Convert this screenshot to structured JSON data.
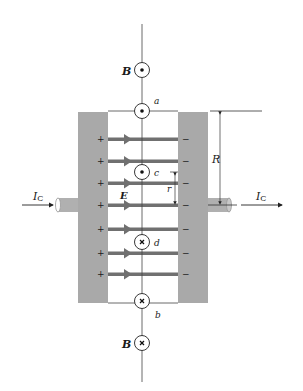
{
  "figure": {
    "type": "physics-diagram"
  },
  "colors": {
    "plate": "#a9a9a9",
    "field_line": "#707070",
    "line": "#333333",
    "background": "#ffffff"
  },
  "labels": {
    "b_top": "B",
    "b_bottom": "B",
    "point_a": "a",
    "point_b": "b",
    "point_c": "c",
    "point_d": "d",
    "e_field": "E",
    "radius_big": "R",
    "radius_small": "r",
    "current_left_main": "I",
    "current_left_sub": "C",
    "current_right_main": "I",
    "current_right_sub": "C"
  },
  "plate_charges": {
    "left": [
      "+",
      "+",
      "+",
      "+",
      "+",
      "+",
      "+",
      "+"
    ],
    "right": [
      "−",
      "−",
      "−",
      "−",
      "−",
      "−",
      "−",
      "−"
    ]
  },
  "field_symbols": {
    "b_top": "out-of-page (dot)",
    "a": "out-of-page (dot)",
    "c": "out-of-page (dot)",
    "d": "into-page (cross)",
    "b": "into-page (cross)",
    "b_bottom": "into-page (cross)"
  }
}
